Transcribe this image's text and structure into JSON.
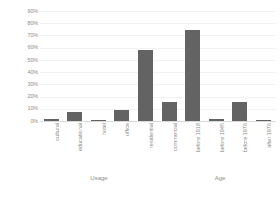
{
  "chart_data": {
    "type": "bar",
    "title": "",
    "subtitle": "",
    "xlabel": "",
    "ylabel": "",
    "ylim": [
      0,
      90
    ],
    "grid": true,
    "legend": "none",
    "orientation": "vertical",
    "bar_color": "#636363",
    "gridline_color": "#f2f2f2",
    "axis_color": "#d9d9d9",
    "tick_label_color": "#8c8c8c",
    "value_suffix": "%",
    "ytick_labels": [
      "90%",
      "80%",
      "70%",
      "60%",
      "50%",
      "40%",
      "30%",
      "20%",
      "10%",
      "0%"
    ],
    "ytick_values": [
      90,
      80,
      70,
      60,
      50,
      40,
      30,
      20,
      10,
      0
    ],
    "categories": [
      "cultural",
      "educational",
      "hotel",
      "office",
      "residential",
      "commercial",
      "before 1918",
      "before 1945",
      "before 1976",
      "after 1976"
    ],
    "values": [
      2,
      7,
      1,
      9,
      58,
      16,
      75,
      2,
      16,
      1
    ],
    "groups": [
      {
        "label": "Usage",
        "start_index": 0,
        "end_index": 5
      },
      {
        "label": "Age",
        "start_index": 6,
        "end_index": 9
      }
    ]
  }
}
